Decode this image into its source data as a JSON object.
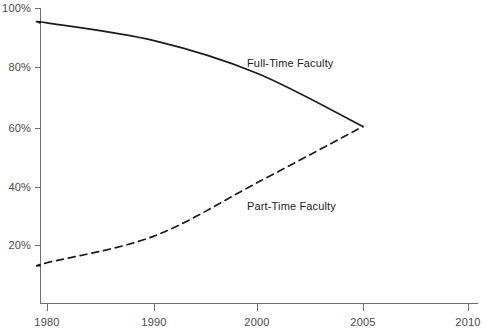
{
  "chart_data": {
    "type": "line",
    "title": "",
    "subtitle": "",
    "xlabel": "",
    "ylabel": "",
    "grid": false,
    "legend_position": "inline-labels",
    "x_categories": [
      "1980",
      "1990",
      "2000",
      "2005",
      "2010"
    ],
    "y_ticks": [
      "20%",
      "40%",
      "60%",
      "80%",
      "100%"
    ],
    "y_tick_values": [
      20,
      40,
      60,
      80,
      100
    ],
    "ylim": [
      0,
      100
    ],
    "series": [
      {
        "name": "Full-Time Faculty",
        "style": "solid",
        "color": "#1c1c1c",
        "x": [
          "1979",
          "1980",
          "1990",
          "2000",
          "2005"
        ],
        "values": [
          95,
          95,
          89,
          78,
          60
        ],
        "label_text": "Full-Time Faculty"
      },
      {
        "name": "Part-Time Faculty",
        "style": "dashed",
        "color": "#1c1c1c",
        "x": [
          "1979",
          "1980",
          "1990",
          "2000",
          "2005"
        ],
        "values": [
          13,
          14,
          23,
          41,
          60
        ],
        "label_text": "Part-Time Faculty"
      }
    ],
    "annotations": [
      {
        "text": "Full-Time Faculty",
        "x": 247,
        "y": 67
      },
      {
        "text": "Part-Time Faculty",
        "x": 247,
        "y": 210
      }
    ]
  },
  "axes": {
    "y_tick_labels": {
      "t100": "100%",
      "t80": "80%",
      "t60": "60%",
      "t40": "40%",
      "t20": "20%"
    },
    "x_tick_labels": {
      "t1980": "1980",
      "t1990": "1990",
      "t2000": "2000",
      "t2005": "2005",
      "t2010": "2010"
    }
  },
  "colors": {
    "background": "#ffffff",
    "axis": "#6f6f6f",
    "tick_text": "#4a4a4a",
    "series": "#1c1c1c"
  }
}
